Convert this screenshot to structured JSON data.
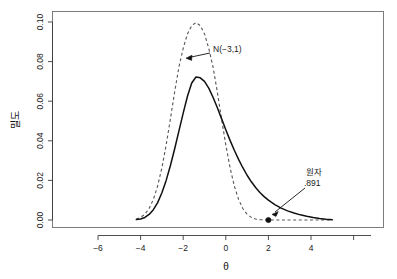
{
  "chart_data": {
    "type": "line",
    "title": "",
    "xlabel": "θ",
    "ylabel": "밀도",
    "xlim": [
      -7.2,
      4.6
    ],
    "ylim": [
      -0.004,
      0.104
    ],
    "grid": false,
    "legend": "none",
    "xticks": [
      -6,
      -4,
      -2,
      0,
      2,
      4
    ],
    "xtick_labels": [
      "−6",
      "−4",
      "−2",
      "0",
      "2",
      "4"
    ],
    "yticks": [
      0.0,
      0.02,
      0.04,
      0.06,
      0.08,
      0.1
    ],
    "ytick_labels": [
      "0.00",
      "0.02",
      "0.04",
      "0.06",
      "0.08",
      "0.10"
    ],
    "series": [
      {
        "name": "사후밀도",
        "style": "solid",
        "color": "#111111",
        "peak_x": -3.4,
        "peak_y": 0.0725,
        "x": [
          -6.2,
          -6.0,
          -5.8,
          -5.6,
          -5.4,
          -5.2,
          -5.0,
          -4.8,
          -4.6,
          -4.4,
          -4.2,
          -4.0,
          -3.8,
          -3.6,
          -3.4,
          -3.2,
          -3.0,
          -2.8,
          -2.6,
          -2.4,
          -2.2,
          -2.0,
          -1.8,
          -1.6,
          -1.4,
          -1.2,
          -1.0,
          -0.8,
          -0.6,
          -0.4,
          -0.2,
          0.0,
          0.3,
          0.6,
          0.9,
          1.2,
          1.5,
          1.8,
          2.1,
          2.4,
          2.7,
          3.0
        ],
        "y": [
          0.0002,
          0.0005,
          0.0013,
          0.0028,
          0.0052,
          0.0088,
          0.0138,
          0.02,
          0.0275,
          0.036,
          0.045,
          0.054,
          0.0625,
          0.0692,
          0.0722,
          0.0718,
          0.07,
          0.0666,
          0.062,
          0.0568,
          0.0512,
          0.0456,
          0.0402,
          0.0352,
          0.0306,
          0.0264,
          0.0226,
          0.0193,
          0.0164,
          0.0139,
          0.0118,
          0.01,
          0.0078,
          0.006,
          0.0046,
          0.0035,
          0.0026,
          0.0019,
          0.0013,
          0.0008,
          0.0004,
          0.0001
        ]
      },
      {
        "name": "N(−3,1)",
        "style": "dashed",
        "color": "#555555",
        "peak_x": -3.0,
        "peak_y": 0.0997,
        "x": [
          -6.2,
          -6.0,
          -5.8,
          -5.6,
          -5.4,
          -5.2,
          -5.0,
          -4.8,
          -4.6,
          -4.4,
          -4.2,
          -4.0,
          -3.8,
          -3.6,
          -3.4,
          -3.2,
          -3.0,
          -2.8,
          -2.6,
          -2.4,
          -2.2,
          -2.0,
          -1.8,
          -1.6,
          -1.4,
          -1.2,
          -1.0,
          -0.8,
          -0.6,
          -0.4,
          -0.2,
          0.0,
          0.5,
          1.0,
          1.5,
          2.0,
          2.5,
          3.0
        ],
        "y": [
          0.0005,
          0.0013,
          0.0029,
          0.0058,
          0.0104,
          0.0172,
          0.0264,
          0.0379,
          0.0511,
          0.0648,
          0.0773,
          0.0867,
          0.094,
          0.0982,
          0.0997,
          0.0982,
          0.094,
          0.0867,
          0.0773,
          0.0648,
          0.0511,
          0.0379,
          0.0264,
          0.0172,
          0.0104,
          0.0058,
          0.0029,
          0.0013,
          0.0005,
          0.0002,
          0.0001,
          0.0,
          0.0,
          0.0,
          0.0,
          0.0,
          0.0,
          0.0
        ]
      }
    ],
    "points": [
      {
        "name": "원자-point",
        "x": 0.0,
        "y": 0.0,
        "marker": "filled-circle"
      }
    ],
    "annotations": [
      {
        "name": "normal-prior-label",
        "text": "N(−3,1)",
        "text_x": 213,
        "text_y": 49,
        "arrow_from_x": 210,
        "arrow_from_y": 53,
        "arrow_to_x": 186,
        "arrow_to_y": 58
      },
      {
        "name": "observed-value-label",
        "line1": "원자",
        "line2": ".891",
        "text_x": 306,
        "text_y": 175,
        "arrow_from_x": 305,
        "arrow_from_y": 188,
        "arrow_to_x": 272,
        "arrow_to_y": 214
      }
    ]
  }
}
